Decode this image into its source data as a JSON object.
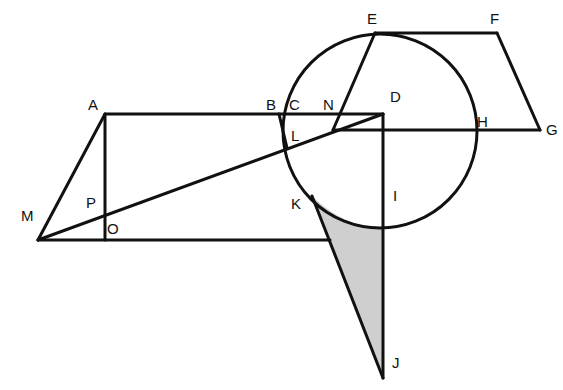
{
  "diagram": {
    "title": "",
    "labels": {
      "A": "A",
      "B": "B",
      "C": "C",
      "D": "D",
      "E": "E",
      "F": "F",
      "G": "G",
      "H": "H",
      "I": "I",
      "J": "J",
      "K": "K",
      "L": "L",
      "M": "M",
      "N": "N",
      "O": "O",
      "P": "P"
    },
    "colors": {
      "stroke": "#111111",
      "shade": "#bdbdbd",
      "background": "#ffffff"
    }
  }
}
